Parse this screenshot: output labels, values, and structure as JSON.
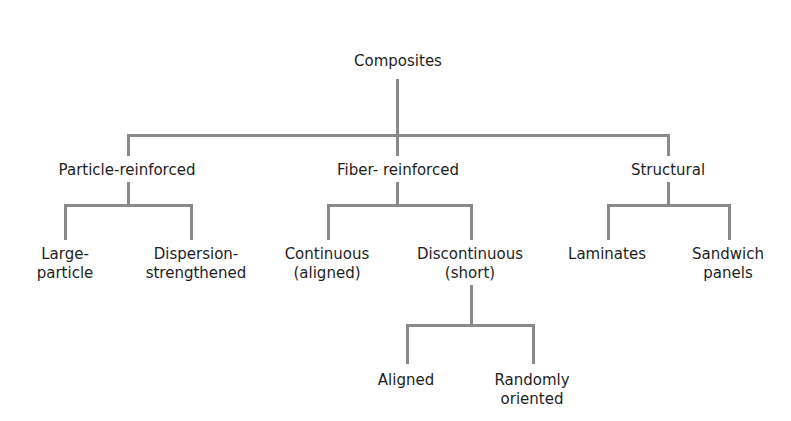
{
  "diagram": {
    "root": {
      "label": "Composites"
    },
    "level1": [
      {
        "label": "Particle-reinforced"
      },
      {
        "label": "Fiber- reinforced"
      },
      {
        "label": "Structural"
      }
    ],
    "particle_children": [
      {
        "line1": "Large-",
        "line2": "particle"
      },
      {
        "line1": "Dispersion-",
        "line2": "strengthened"
      }
    ],
    "fiber_children": [
      {
        "line1": "Continuous",
        "line2": "(aligned)"
      },
      {
        "line1": "Discontinuous",
        "line2": "(short)"
      }
    ],
    "structural_children": [
      {
        "line1": "Laminates"
      },
      {
        "line1": "Sandwich",
        "line2": "panels"
      }
    ],
    "discontinuous_children": [
      {
        "line1": "Aligned"
      },
      {
        "line1": "Randomly",
        "line2": "oriented"
      }
    ],
    "line_color": "#8a8a8a"
  }
}
